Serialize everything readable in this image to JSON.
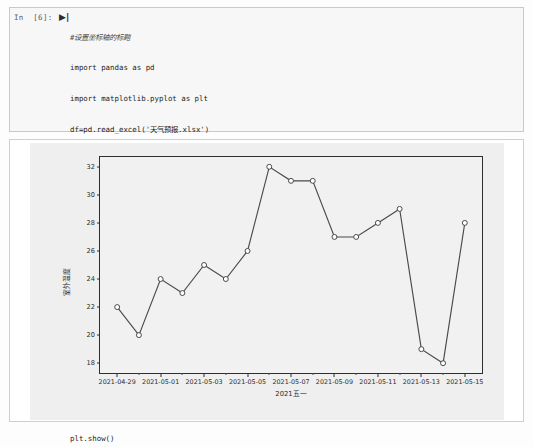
{
  "cell": {
    "prompt": "In  [6]:",
    "run_marker": "▶|",
    "code_lines": [
      {
        "text": "#设置坐标轴的标题",
        "kind": "comment"
      },
      {
        "text": "import pandas as pd",
        "kind": "code"
      },
      {
        "text": "import matplotlib.pyplot as plt",
        "kind": "code"
      },
      {
        "text": "df=pd.read_excel('天气预报.xlsx')",
        "kind": "code"
      },
      {
        "text": "",
        "kind": "blank"
      },
      {
        "text": "#用于处理中文",
        "kind": "comment"
      },
      {
        "text": "plt.rcParams['font.sans-serif']=['SimHei']",
        "kind": "code"
      },
      {
        "text": "plt.figure(facecolor='yellow',figsize=(10,6))",
        "kind": "code"
      },
      {
        "text": "x=df['日期']",
        "kind": "code"
      },
      {
        "text": "y=df['温度']",
        "kind": "code"
      },
      {
        "text": "plt.xlabel('2021五一')",
        "kind": "code"
      },
      {
        "text": "plt.ylabel('室外温度')",
        "kind": "code"
      },
      {
        "text": "plt.plot(x,y,marker='o',color='r',markerfacecolor='w')",
        "kind": "code"
      },
      {
        "text": "plt.show()",
        "kind": "code"
      }
    ]
  },
  "chart_data": {
    "type": "line",
    "title": "",
    "xlabel": "2021五一",
    "ylabel": "室外温度",
    "x": [
      "2021-04-29",
      "2021-04-30",
      "2021-05-01",
      "2021-05-02",
      "2021-05-03",
      "2021-05-04",
      "2021-05-05",
      "2021-05-06",
      "2021-05-07",
      "2021-05-08",
      "2021-05-09",
      "2021-05-10",
      "2021-05-11",
      "2021-05-12",
      "2021-05-13",
      "2021-05-14",
      "2021-05-15"
    ],
    "values": [
      22,
      20,
      24,
      23,
      25,
      24,
      26,
      32,
      31,
      31,
      27,
      27,
      28,
      29,
      19,
      18,
      28
    ],
    "xtick_labels": [
      "2021-04-29",
      "2021-05-01",
      "2021-05-03",
      "2021-05-05",
      "2021-05-07",
      "2021-05-09",
      "2021-05-11",
      "2021-05-13",
      "2021-05-15"
    ],
    "ytick_labels": [
      "18",
      "20",
      "22",
      "24",
      "26",
      "28",
      "30",
      "32"
    ],
    "ylim": [
      17.3,
      32.7
    ],
    "grid": false,
    "legend": null,
    "marker": "o",
    "line_color": "#4a4a4a",
    "marker_face_color": "#ffffff",
    "figure_facecolor": "#efefef"
  }
}
